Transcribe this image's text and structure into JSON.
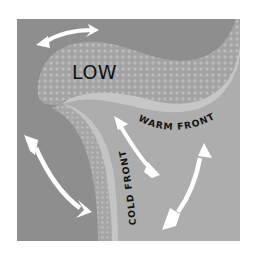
{
  "diagram": {
    "labels": {
      "low": "LOW",
      "warm_front": "WARM FRONT",
      "cold_front": "COLD FRONT"
    },
    "colors": {
      "page_background": "#ffffff",
      "cold_air_region": "#8e8e8e",
      "warm_air_region": "#a9a9a9",
      "low_band": "#a0a0a0",
      "low_band_dots": "#b9b9b9",
      "front_edge": "#c4c4c4",
      "arrow": "#ffffff",
      "text": "#111111"
    },
    "arrows": [
      {
        "id": "top-left",
        "description": "curved double-headed arrow above LOW band"
      },
      {
        "id": "bottom-left",
        "description": "curved double-headed arrow in cold air region"
      },
      {
        "id": "middle",
        "description": "double-headed arrow between cold and warm fronts"
      },
      {
        "id": "bottom-right",
        "description": "curved double-headed arrow in warm sector"
      }
    ]
  }
}
